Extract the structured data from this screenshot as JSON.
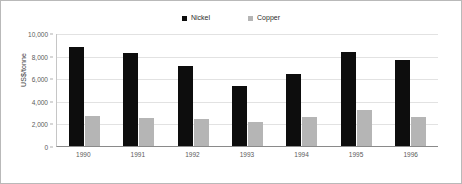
{
  "chart_data": {
    "type": "bar",
    "title": "",
    "subtitle": "",
    "xlabel": "",
    "ylabel": "US$/tonne",
    "ylim": [
      0,
      10000
    ],
    "yticks": [
      "0",
      "2,000",
      "4,000",
      "6,000",
      "8,000",
      "10,000"
    ],
    "ytick_values": [
      0,
      2000,
      4000,
      6000,
      8000,
      10000
    ],
    "grid": true,
    "legend_position": "top-center",
    "categories": [
      "1990",
      "1991",
      "1992",
      "1993",
      "1994",
      "1995",
      "1996"
    ],
    "series": [
      {
        "name": "Nickel",
        "color": "#0d0d0d",
        "values": [
          8800,
          8200,
          7050,
          5350,
          6400,
          8350,
          7600
        ]
      },
      {
        "name": "Copper",
        "color": "#b5b5b5",
        "values": [
          2700,
          2450,
          2400,
          2150,
          2550,
          3200,
          2550
        ]
      }
    ]
  },
  "legend": {
    "items": [
      {
        "label": "Nickel",
        "swatch_icon": "square-swatch-icon",
        "color": "#0d0d0d"
      },
      {
        "label": "Copper",
        "swatch_icon": "square-swatch-icon",
        "color": "#b5b5b5"
      }
    ]
  },
  "axes": {
    "y_title": "US$/tonne"
  },
  "colors": {
    "frame_border": "#b9b9b9",
    "gridline": "#e2e2e2",
    "axis_line": "#8a8a8a",
    "tick_text": "#5a5a5a",
    "background": "#ffffff"
  }
}
